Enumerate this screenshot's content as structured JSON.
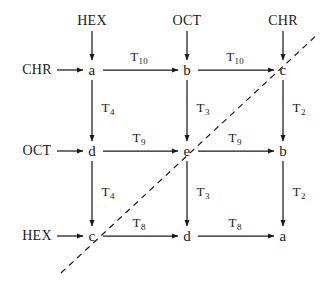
{
  "diagram": {
    "background_color": "#ffffff",
    "stroke_color": "#1a1a1a",
    "nodes": [
      {
        "id": "n00",
        "label": "a",
        "x": 92,
        "y": 70
      },
      {
        "id": "n01",
        "label": "b",
        "x": 187,
        "y": 70
      },
      {
        "id": "n02",
        "label": "c",
        "x": 283,
        "y": 70
      },
      {
        "id": "n10",
        "label": "d",
        "x": 92,
        "y": 151
      },
      {
        "id": "n11",
        "label": "e",
        "x": 187,
        "y": 151
      },
      {
        "id": "n12",
        "label": "b",
        "x": 283,
        "y": 151
      },
      {
        "id": "n20",
        "label": "c",
        "x": 92,
        "y": 236
      },
      {
        "id": "n21",
        "label": "d",
        "x": 187,
        "y": 236
      },
      {
        "id": "n22",
        "label": "a",
        "x": 283,
        "y": 236
      }
    ],
    "source_labels": [
      {
        "id": "top-col0",
        "text": "HEX",
        "x": 92,
        "y": 21,
        "direction": "down"
      },
      {
        "id": "top-col1",
        "text": "OCT",
        "x": 187,
        "y": 21,
        "direction": "down"
      },
      {
        "id": "top-col2",
        "text": "CHR",
        "x": 283,
        "y": 21,
        "direction": "down"
      },
      {
        "id": "left-row0",
        "text": "CHR",
        "x": 37,
        "y": 70,
        "direction": "right"
      },
      {
        "id": "left-row1",
        "text": "OCT",
        "x": 37,
        "y": 151,
        "direction": "right"
      },
      {
        "id": "left-row2",
        "text": "HEX",
        "x": 37,
        "y": 236,
        "direction": "right"
      }
    ],
    "edge_labels": [
      {
        "id": "e-r0-c0c1",
        "base": "T",
        "sub": "10",
        "x": 139,
        "y": 56
      },
      {
        "id": "e-r0-c1c2",
        "base": "T",
        "sub": "10",
        "x": 235,
        "y": 56
      },
      {
        "id": "e-r1-c0c1",
        "base": "T",
        "sub": "9",
        "x": 139,
        "y": 137
      },
      {
        "id": "e-r1-c1c2",
        "base": "T",
        "sub": "9",
        "x": 235,
        "y": 137
      },
      {
        "id": "e-r2-c0c1",
        "base": "T",
        "sub": "8",
        "x": 139,
        "y": 222
      },
      {
        "id": "e-r2-c1c2",
        "base": "T",
        "sub": "8",
        "x": 235,
        "y": 222
      },
      {
        "id": "e-c0-r0r1",
        "base": "T",
        "sub": "4",
        "x": 108,
        "y": 107
      },
      {
        "id": "e-c1-r0r1",
        "base": "T",
        "sub": "3",
        "x": 203,
        "y": 107
      },
      {
        "id": "e-c2-r0r1",
        "base": "T",
        "sub": "2",
        "x": 299,
        "y": 107
      },
      {
        "id": "e-c0-r1r2",
        "base": "T",
        "sub": "4",
        "x": 108,
        "y": 191
      },
      {
        "id": "e-c1-r1r2",
        "base": "T",
        "sub": "3",
        "x": 203,
        "y": 191
      },
      {
        "id": "e-c2-r1r2",
        "base": "T",
        "sub": "2",
        "x": 299,
        "y": 191
      }
    ],
    "dashed_line": {
      "id": "diagonal-boundary",
      "x1": 61,
      "y1": 273,
      "x2": 319,
      "y2": 33,
      "dash": "6 5"
    }
  }
}
